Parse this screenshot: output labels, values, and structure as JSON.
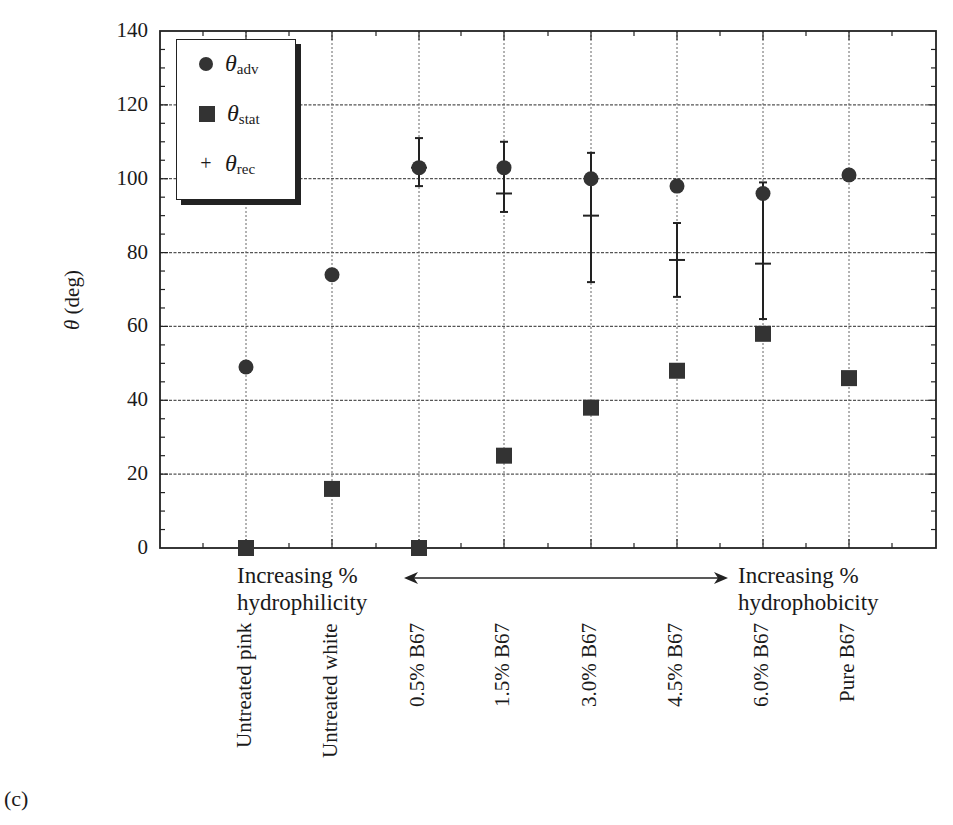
{
  "figure_label": "(c)",
  "y_axis": {
    "label_symbol": "θ",
    "label_unit": "(deg)",
    "ticks": [
      "0",
      "20",
      "40",
      "60",
      "80",
      "100",
      "120",
      "140"
    ]
  },
  "legend": {
    "items": [
      {
        "symbol": "circle",
        "base": "θ",
        "sub": "adv"
      },
      {
        "symbol": "square",
        "base": "θ",
        "sub": "stat"
      },
      {
        "symbol": "plus",
        "base": "θ",
        "sub": "rec"
      }
    ]
  },
  "annotations": {
    "left_line1": "Increasing %",
    "left_line2": "hydrophilicity",
    "right_line1": "Increasing %",
    "right_line2": "hydrophobicity"
  },
  "categories": [
    "Untreated pink",
    "Untreated white",
    "0.5% B67",
    "1.5% B67",
    "3.0% B67",
    "4.5% B67",
    "6.0% B67",
    "Pure B67"
  ],
  "chart_data": {
    "type": "scatter",
    "title": "",
    "xlabel": "",
    "ylabel": "θ (deg)",
    "ylim": [
      0,
      140
    ],
    "yticks": [
      0,
      20,
      40,
      60,
      80,
      100,
      120,
      140
    ],
    "grid": true,
    "legend_position": "upper left",
    "categories": [
      "Untreated pink",
      "Untreated white",
      "0.5% B67",
      "1.5% B67",
      "3.0% B67",
      "4.5% B67",
      "6.0% B67",
      "Pure B67"
    ],
    "series": [
      {
        "name": "θadv",
        "marker": "circle",
        "values": [
          49,
          74,
          103,
          103,
          100,
          98,
          96,
          101
        ]
      },
      {
        "name": "θstat",
        "marker": "square",
        "values": [
          0,
          16,
          0,
          25,
          38,
          48,
          58,
          46
        ]
      },
      {
        "name": "θrec",
        "marker": "plus",
        "values": [
          null,
          null,
          103,
          96,
          90,
          78,
          77,
          null
        ],
        "error_low": [
          null,
          null,
          98,
          91,
          72,
          68,
          62,
          null
        ],
        "error_high": [
          null,
          null,
          111,
          110,
          107,
          88,
          99,
          null
        ]
      }
    ],
    "annotations": [
      "Increasing % hydrophilicity",
      "Increasing % hydrophobicity",
      "(c)"
    ]
  }
}
